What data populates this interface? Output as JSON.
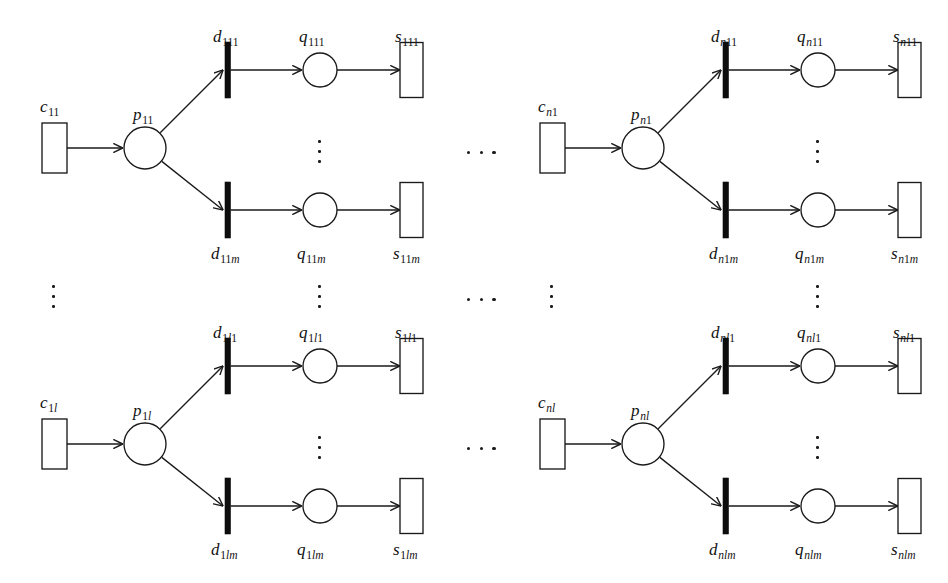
{
  "diagram": {
    "type": "petri-net",
    "stroke_color": "#1a1a1a",
    "transition_fill": "#0d0d0d",
    "background": "#ffffff",
    "node_kinds": {
      "c": "source-place-rectangle",
      "p": "place-circle",
      "d": "transition-bar",
      "q": "place-circle",
      "s": "sink-place-rectangle"
    }
  },
  "blocks": [
    {
      "id": "block-top-left",
      "origin": {
        "x": 0,
        "y": 0
      },
      "source": {
        "name": "c",
        "sub": "11",
        "sub_italic": ""
      },
      "place": {
        "name": "p",
        "sub": "11",
        "sub_italic": ""
      },
      "rows": [
        {
          "id": "row-top",
          "transition": {
            "name": "d",
            "sub": "111",
            "sub_italic": ""
          },
          "queue": {
            "name": "q",
            "sub": "111",
            "sub_italic": ""
          },
          "sink": {
            "name": "s",
            "sub": "111",
            "sub_italic": ""
          }
        },
        {
          "id": "row-bottom",
          "transition": {
            "name": "d",
            "sub": "11",
            "sub_italic": "m"
          },
          "queue": {
            "name": "q",
            "sub": "11",
            "sub_italic": "m"
          },
          "sink": {
            "name": "s",
            "sub": "11",
            "sub_italic": "m"
          }
        }
      ]
    },
    {
      "id": "block-top-right",
      "origin": {
        "x": 498,
        "y": 0
      },
      "source": {
        "name": "c",
        "sub": "1",
        "sub_italic": "n"
      },
      "place": {
        "name": "p",
        "sub": "1",
        "sub_italic": "n"
      },
      "rows": [
        {
          "id": "row-top",
          "transition": {
            "name": "d",
            "sub": "11",
            "sub_italic": "n"
          },
          "queue": {
            "name": "q",
            "sub": "11",
            "sub_italic": "n"
          },
          "sink": {
            "name": "s",
            "sub": "11",
            "sub_italic": "n"
          }
        },
        {
          "id": "row-bottom",
          "transition": {
            "name": "d",
            "sub": "1",
            "sub_italic": "nm"
          },
          "queue": {
            "name": "q",
            "sub": "1",
            "sub_italic": "nm"
          },
          "sink": {
            "name": "s",
            "sub": "1",
            "sub_italic": "nm"
          }
        }
      ]
    },
    {
      "id": "block-bottom-left",
      "origin": {
        "x": 0,
        "y": 296
      },
      "source": {
        "name": "c",
        "sub": "1",
        "sub_italic": "l"
      },
      "place": {
        "name": "p",
        "sub": "1",
        "sub_italic": "l"
      },
      "rows": [
        {
          "id": "row-top",
          "transition": {
            "name": "d",
            "sub": "1",
            "sub_italic": "l",
            "sub_tail": "1"
          },
          "queue": {
            "name": "q",
            "sub": "1",
            "sub_italic": "l",
            "sub_tail": "1"
          },
          "sink": {
            "name": "s",
            "sub": "1",
            "sub_italic": "l",
            "sub_tail": "1"
          }
        },
        {
          "id": "row-bottom",
          "transition": {
            "name": "d",
            "sub": "1",
            "sub_italic": "lm"
          },
          "queue": {
            "name": "q",
            "sub": "1",
            "sub_italic": "lm"
          },
          "sink": {
            "name": "s",
            "sub": "1",
            "sub_italic": "lm"
          }
        }
      ]
    },
    {
      "id": "block-bottom-right",
      "origin": {
        "x": 498,
        "y": 296
      },
      "source": {
        "name": "c",
        "sub": "",
        "sub_italic": "nl"
      },
      "place": {
        "name": "p",
        "sub": "",
        "sub_italic": "nl"
      },
      "rows": [
        {
          "id": "row-top",
          "transition": {
            "name": "d",
            "sub": "",
            "sub_italic": "nl",
            "sub_tail": "1"
          },
          "queue": {
            "name": "q",
            "sub": "",
            "sub_italic": "nl",
            "sub_tail": "1"
          },
          "sink": {
            "name": "s",
            "sub": "",
            "sub_italic": "nl",
            "sub_tail": "1"
          }
        },
        {
          "id": "row-bottom",
          "transition": {
            "name": "d",
            "sub": "",
            "sub_italic": "nlm"
          },
          "queue": {
            "name": "q",
            "sub": "",
            "sub_italic": "nlm"
          },
          "sink": {
            "name": "s",
            "sub": "",
            "sub_italic": "nlm"
          }
        }
      ]
    }
  ],
  "labels": {
    "c_11": "c",
    "c_11_sub": "11",
    "p_11": "p",
    "p_11_sub": "11",
    "d_111": "d",
    "d_111_sub": "111",
    "q_111": "q",
    "q_111_sub": "111",
    "s_111": "s",
    "s_111_sub": "111",
    "d_11m": "d",
    "q_11m": "q",
    "s_11m": "s",
    "c_n1": "c",
    "p_n1": "p",
    "d_n11": "d",
    "q_n11": "q",
    "s_n11": "s",
    "d_n1m": "d",
    "q_n1m": "q",
    "s_n1m": "s",
    "c_1l": "c",
    "p_1l": "p",
    "d_1l1": "d",
    "q_1l1": "q",
    "s_1l1": "s",
    "d_1lm": "d",
    "q_1lm": "q",
    "s_1lm": "s",
    "c_nl": "c",
    "p_nl": "p",
    "d_nl1": "d",
    "q_nl1": "q",
    "s_nl1": "s",
    "d_nlm": "d",
    "q_nlm": "q",
    "s_nlm": "s"
  },
  "ellipses": {
    "vertical_label": "vertical-continuation",
    "horizontal_label": "horizontal-continuation",
    "count": 3
  }
}
